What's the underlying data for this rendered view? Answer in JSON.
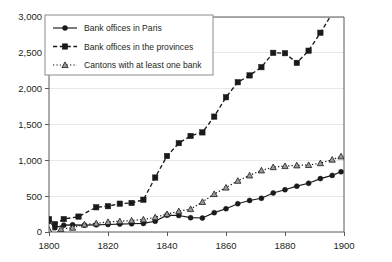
{
  "chart_data": {
    "type": "line",
    "title": "",
    "xlabel": "",
    "ylabel": "",
    "xlim": [
      1800,
      1900
    ],
    "ylim": [
      0,
      3000
    ],
    "grid": true,
    "legend_position": "top-left",
    "x_ticks": [
      1800,
      1820,
      1840,
      1860,
      1880,
      1900
    ],
    "x_tick_labels": [
      "1800",
      "1820",
      "1840",
      "1860",
      "1880",
      "1900"
    ],
    "y_ticks": [
      0,
      500,
      1000,
      1500,
      2000,
      2500,
      3000
    ],
    "y_tick_labels": [
      "0",
      "500",
      "1,000",
      "1,500",
      "2,000",
      "2,500",
      "3,000"
    ],
    "series": [
      {
        "name": "Bank offices in Paris",
        "marker": "circle",
        "line_style": "solid",
        "x": [
          1800,
          1802,
          1805,
          1808,
          1812,
          1816,
          1820,
          1824,
          1828,
          1832,
          1836,
          1840,
          1844,
          1848,
          1852,
          1856,
          1860,
          1864,
          1868,
          1872,
          1876,
          1880,
          1884,
          1888,
          1892,
          1896,
          1899
        ],
        "values": [
          150,
          60,
          95,
          100,
          95,
          100,
          105,
          110,
          115,
          120,
          150,
          235,
          230,
          200,
          195,
          270,
          325,
          395,
          440,
          470,
          545,
          590,
          640,
          680,
          745,
          790,
          840
        ]
      },
      {
        "name": "Bank offices in the provinces",
        "marker": "square",
        "line_style": "dashed",
        "x": [
          1800,
          1802,
          1805,
          1810,
          1816,
          1820,
          1824,
          1828,
          1832,
          1836,
          1840,
          1844,
          1848,
          1852,
          1856,
          1860,
          1864,
          1868,
          1872,
          1876,
          1880,
          1884,
          1888,
          1892,
          1896,
          1900
        ],
        "values": [
          180,
          110,
          180,
          215,
          345,
          360,
          395,
          405,
          450,
          760,
          1060,
          1240,
          1340,
          1390,
          1610,
          1880,
          2090,
          2185,
          2300,
          2500,
          2495,
          2360,
          2530,
          2780,
          3050,
          3400
        ]
      },
      {
        "name": "Cantons with at least one bank",
        "marker": "triangle",
        "line_style": "dotted",
        "x": [
          1800,
          1804,
          1808,
          1812,
          1816,
          1820,
          1824,
          1828,
          1832,
          1836,
          1840,
          1844,
          1848,
          1852,
          1856,
          1860,
          1864,
          1868,
          1872,
          1876,
          1880,
          1884,
          1888,
          1892,
          1896,
          1899
        ],
        "values": [
          30,
          40,
          60,
          105,
          120,
          140,
          150,
          160,
          175,
          205,
          250,
          290,
          320,
          420,
          530,
          620,
          715,
          790,
          860,
          905,
          920,
          930,
          935,
          960,
          1010,
          1055
        ]
      }
    ]
  },
  "legend": {
    "entries": [
      {
        "label": "Bank offices in Paris"
      },
      {
        "label": "Bank offices in the provinces"
      },
      {
        "label": "Cantons with at least one bank"
      }
    ]
  }
}
